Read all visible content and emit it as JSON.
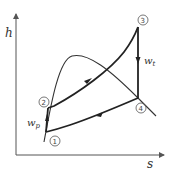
{
  "diagram": {
    "type": "h-s diagram (Rankine cycle)",
    "axes": {
      "y_label": "h",
      "x_label": "s"
    },
    "states": [
      {
        "id": "1",
        "label": "①"
      },
      {
        "id": "2",
        "label": "②"
      },
      {
        "id": "3",
        "label": "③"
      },
      {
        "id": "4",
        "label": "④"
      }
    ],
    "work_labels": {
      "pump": {
        "main": "w",
        "sub": "p"
      },
      "turbine": {
        "main": "w",
        "sub": "t"
      }
    },
    "colors": {
      "line": "#333333",
      "axis": "#555555",
      "background": "#ffffff"
    }
  }
}
